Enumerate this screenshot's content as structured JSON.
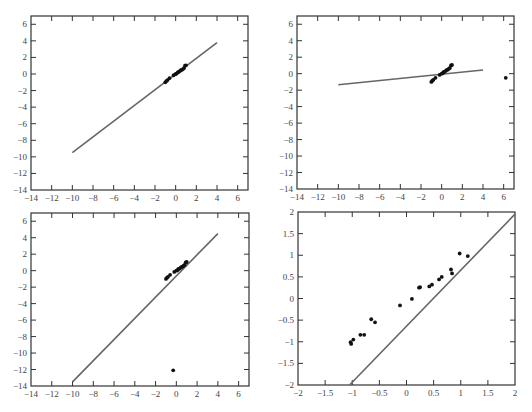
{
  "chart_data": [
    {
      "type": "scatter",
      "panel": "top-left",
      "title": "",
      "xlabel": "",
      "ylabel": "",
      "xlim": [
        -14,
        7
      ],
      "ylim": [
        -14,
        7
      ],
      "xticks": [
        -14,
        -12,
        -10,
        -8,
        -6,
        -4,
        -2,
        0,
        2,
        4,
        6
      ],
      "yticks": [
        -14,
        -12,
        -10,
        -8,
        -6,
        -4,
        -2,
        0,
        2,
        4,
        6
      ],
      "grid": false,
      "points": [
        [
          -1.0,
          -1.0
        ],
        [
          -0.9,
          -0.85
        ],
        [
          -0.8,
          -0.75
        ],
        [
          -0.6,
          -0.5
        ],
        [
          -0.2,
          -0.15
        ],
        [
          0.0,
          0.0
        ],
        [
          0.1,
          0.05
        ],
        [
          0.2,
          0.2
        ],
        [
          0.3,
          0.25
        ],
        [
          0.4,
          0.35
        ],
        [
          0.5,
          0.45
        ],
        [
          0.6,
          0.5
        ],
        [
          0.7,
          0.6
        ],
        [
          0.8,
          0.7
        ],
        [
          0.9,
          1.0
        ],
        [
          1.0,
          1.05
        ]
      ],
      "line": [
        [
          -10,
          -9.5
        ],
        [
          4,
          3.8
        ]
      ]
    },
    {
      "type": "scatter",
      "panel": "top-right",
      "title": "",
      "xlabel": "",
      "ylabel": "",
      "xlim": [
        -14,
        7
      ],
      "ylim": [
        -14,
        7
      ],
      "xticks": [
        -14,
        -12,
        -10,
        -8,
        -6,
        -4,
        -2,
        0,
        2,
        4,
        6
      ],
      "yticks": [
        -14,
        -12,
        -10,
        -8,
        -6,
        -4,
        -2,
        0,
        2,
        4,
        6
      ],
      "grid": false,
      "points": [
        [
          -1.0,
          -1.0
        ],
        [
          -0.9,
          -0.85
        ],
        [
          -0.8,
          -0.75
        ],
        [
          -0.6,
          -0.5
        ],
        [
          -0.2,
          -0.15
        ],
        [
          0.0,
          0.0
        ],
        [
          0.1,
          0.05
        ],
        [
          0.2,
          0.2
        ],
        [
          0.3,
          0.25
        ],
        [
          0.4,
          0.35
        ],
        [
          0.5,
          0.45
        ],
        [
          0.6,
          0.5
        ],
        [
          0.7,
          0.6
        ],
        [
          0.8,
          0.7
        ],
        [
          0.9,
          1.0
        ],
        [
          1.0,
          1.05
        ],
        [
          6.2,
          -0.5
        ]
      ],
      "line": [
        [
          -10,
          -1.35
        ],
        [
          4,
          0.45
        ]
      ]
    },
    {
      "type": "scatter",
      "panel": "bottom-left",
      "title": "",
      "xlabel": "",
      "ylabel": "",
      "xlim": [
        -14,
        7
      ],
      "ylim": [
        -14,
        7
      ],
      "xticks": [
        -14,
        -12,
        -10,
        -8,
        -6,
        -4,
        -2,
        0,
        2,
        4,
        6
      ],
      "yticks": [
        -14,
        -12,
        -10,
        -8,
        -6,
        -4,
        -2,
        0,
        2,
        4,
        6
      ],
      "grid": false,
      "points": [
        [
          -1.0,
          -1.0
        ],
        [
          -0.9,
          -0.85
        ],
        [
          -0.8,
          -0.75
        ],
        [
          -0.6,
          -0.5
        ],
        [
          -0.2,
          -0.15
        ],
        [
          0.0,
          0.0
        ],
        [
          0.1,
          0.05
        ],
        [
          0.2,
          0.2
        ],
        [
          0.3,
          0.25
        ],
        [
          0.4,
          0.35
        ],
        [
          0.5,
          0.45
        ],
        [
          0.6,
          0.5
        ],
        [
          0.7,
          0.6
        ],
        [
          0.8,
          0.7
        ],
        [
          0.9,
          1.0
        ],
        [
          1.0,
          1.05
        ],
        [
          -0.3,
          -12.1
        ]
      ],
      "line": [
        [
          -10,
          -13.5
        ],
        [
          4,
          4.5
        ]
      ]
    },
    {
      "type": "scatter",
      "panel": "bottom-right",
      "title": "",
      "xlabel": "",
      "ylabel": "",
      "xlim": [
        -2,
        2
      ],
      "ylim": [
        -2,
        2
      ],
      "xticks": [
        -2,
        -1.5,
        -1,
        -0.5,
        0,
        0.5,
        1,
        1.5,
        2
      ],
      "yticks": [
        -2,
        -1.5,
        -1,
        -0.5,
        0,
        0.5,
        1,
        1.5,
        2
      ],
      "grid": false,
      "points": [
        [
          -1.03,
          -1.01
        ],
        [
          -1.02,
          -1.05
        ],
        [
          -0.98,
          -0.95
        ],
        [
          -0.85,
          -0.84
        ],
        [
          -0.78,
          -0.84
        ],
        [
          -0.65,
          -0.48
        ],
        [
          -0.58,
          -0.55
        ],
        [
          -0.12,
          -0.16
        ],
        [
          0.1,
          -0.01
        ],
        [
          0.23,
          0.25
        ],
        [
          0.25,
          0.26
        ],
        [
          0.42,
          0.28
        ],
        [
          0.47,
          0.32
        ],
        [
          0.6,
          0.44
        ],
        [
          0.65,
          0.5
        ],
        [
          0.82,
          0.67
        ],
        [
          0.84,
          0.58
        ],
        [
          0.98,
          1.04
        ],
        [
          1.13,
          0.98
        ]
      ],
      "line": [
        [
          -1.05,
          -2
        ],
        [
          2,
          1.95
        ]
      ]
    }
  ],
  "panels_layout": [
    {
      "x0": 31,
      "x1": 248,
      "y0": 16,
      "y1": 190
    },
    {
      "x0": 297,
      "x1": 514,
      "y0": 16,
      "y1": 189
    },
    {
      "x0": 31,
      "x1": 249,
      "y0": 213,
      "y1": 386
    },
    {
      "x0": 298,
      "x1": 515,
      "y0": 212,
      "y1": 385
    }
  ],
  "colors": {
    "frame": "#333333",
    "line": "#666666",
    "points": "#111111",
    "labels": "#444444"
  }
}
